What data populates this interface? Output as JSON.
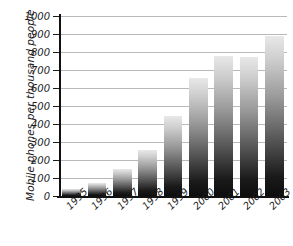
{
  "chart_data": {
    "type": "bar",
    "title": "",
    "subtitle": "",
    "xlabel": "",
    "ylabel": "Mobile phones per thousand people",
    "categories": [
      "1995",
      "1996",
      "1997",
      "1998",
      "1999",
      "2000",
      "2001",
      "2002",
      "2003"
    ],
    "values": [
      40,
      75,
      150,
      255,
      445,
      655,
      780,
      770,
      890
    ],
    "series": [
      {
        "name": "Mobile phones per thousand people",
        "values": [
          40,
          75,
          150,
          255,
          445,
          655,
          780,
          770,
          890
        ]
      }
    ],
    "ylim": [
      0,
      1000
    ],
    "ytick_labels": [
      "0",
      "100",
      "200",
      "300",
      "400",
      "500",
      "600",
      "700",
      "800",
      "900",
      "1000"
    ],
    "ytick_values": [
      0,
      100,
      200,
      300,
      400,
      500,
      600,
      700,
      800,
      900,
      1000
    ],
    "grid": true,
    "grid_axis": "y",
    "legend": false,
    "legend_position": "none",
    "bar_fill": "vertical-gradient-light-to-dark",
    "bar_color_top": "#e8e8e8",
    "bar_color_bottom": "#0d0d0d",
    "gridline_color": "#b9b9b9",
    "axis_color": "#111111",
    "background_color": "#ffffff",
    "xtick_label_rotation": -45
  }
}
